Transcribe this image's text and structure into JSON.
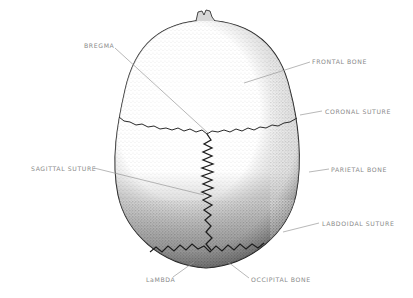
{
  "diagram": {
    "colors": {
      "background": "#ffffff",
      "label_text": "#8a8a8a",
      "leader_line": "#9a9a9a",
      "outline": "#1a1a1a",
      "suture": "#2a2a2a"
    },
    "labels": [
      {
        "id": "bregma",
        "text": "BREGMA",
        "x": 84,
        "y": 45
      },
      {
        "id": "frontal-bone",
        "text": "FRONTAL BONE",
        "x": 312,
        "y": 58
      },
      {
        "id": "coronal-suture",
        "text": "CORONAL SUTURE",
        "x": 325,
        "y": 108
      },
      {
        "id": "sagittal-suture",
        "text": "SAGITTAL SUTURE",
        "x": 31,
        "y": 165
      },
      {
        "id": "parietal-bone",
        "text": "PARIETAL BONE",
        "x": 331,
        "y": 166
      },
      {
        "id": "lambdoidal-suture",
        "text": "LABDOIDAL SUTURE",
        "x": 322,
        "y": 220
      },
      {
        "id": "lambda",
        "text": "LaMBDA",
        "x": 146,
        "y": 276
      },
      {
        "id": "occipital-bone",
        "text": "OCCIPITAL BONE",
        "x": 251,
        "y": 276
      }
    ]
  }
}
